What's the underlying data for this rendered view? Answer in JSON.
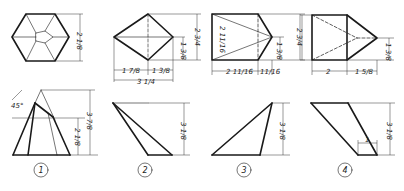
{
  "problems": [
    {
      "number": "1",
      "top_view": {
        "shape": "hexagon-pyramid",
        "dimensions": [
          "2 1/8"
        ]
      },
      "front_view": {
        "dimensions": [
          "3 7/8",
          "2 1/8"
        ],
        "angle": "45°"
      }
    },
    {
      "number": "2",
      "top_view": {
        "shape": "rhombus",
        "dimensions": [
          "1 7/8",
          "1 3/8",
          "3 1/4",
          "1 3/8",
          "2 3/4"
        ]
      },
      "front_view": {
        "dimensions": [
          "3 1/8"
        ]
      }
    },
    {
      "number": "3",
      "top_view": {
        "shape": "pentagon",
        "dimensions": [
          "2 11/16",
          "2 11/16",
          "11/16",
          "1 3/8",
          "2 3/4"
        ]
      },
      "front_view": {
        "dimensions": [
          "3 1/8"
        ]
      }
    },
    {
      "number": "4",
      "top_view": {
        "shape": "pentagon-dashed",
        "dimensions": [
          "2",
          "1 5/8",
          "1 3/8"
        ]
      },
      "front_view": {
        "dimensions": [
          "3 1/8",
          "1"
        ]
      }
    }
  ],
  "labels": {
    "p1_top_dim": "2 1/8",
    "p1_front_angle": "45°",
    "p1_front_h1": "3 7/8",
    "p1_front_h2": "2 1/8",
    "p2_w1": "1 7/8",
    "p2_w2": "1 3/8",
    "p2_w_total": "3 1/4",
    "p2_h1": "1 3/8",
    "p2_h2": "2 3/4",
    "p2_front_h": "3 1/8",
    "p3_h_inner": "2 11/16",
    "p3_w1": "2 11/16",
    "p3_w2": "11/16",
    "p3_h1": "1 3/8",
    "p3_h2": "2 3/4",
    "p3_front_h": "3 1/8",
    "p4_w1": "2",
    "p4_w2": "1 5/8",
    "p4_h1": "1 3/8",
    "p4_front_h": "3 1/8",
    "p4_small": "1",
    "n1": "1",
    "n2": "2",
    "n3": "3",
    "n4": "4"
  }
}
